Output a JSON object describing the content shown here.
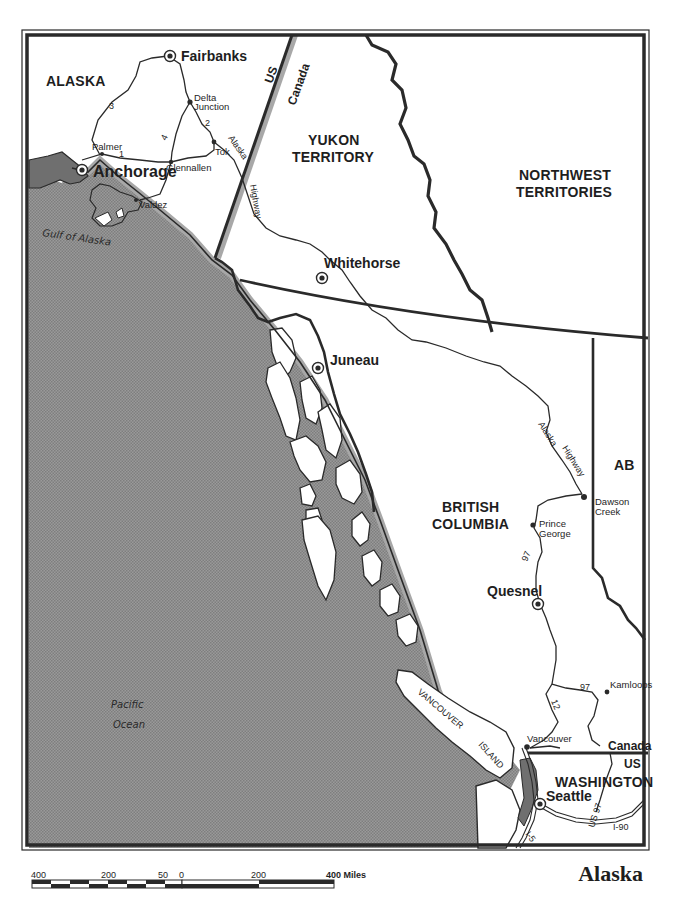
{
  "title": "Alaska",
  "colors": {
    "water": "#8f8f8f",
    "land": "#ffffff",
    "border": "#2a2a2a",
    "coast_shadow": "#a8a8a8",
    "ink": "#1e1e1e"
  },
  "regions": {
    "alaska": "ALASKA",
    "yukon_1": "YUKON",
    "yukon_2": "TERRITORY",
    "nwt_1": "NORTHWEST",
    "nwt_2": "TERRITORIES",
    "bc_1": "BRITISH",
    "bc_2": "COLUMBIA",
    "alberta": "AB",
    "washington": "WASHINGTON"
  },
  "border_labels": {
    "us_north": "US",
    "canada_north": "Canada",
    "canada_south": "Canada",
    "us_south": "US"
  },
  "cities": {
    "fairbanks": "Fairbanks",
    "anchorage": "Anchorage",
    "whitehorse": "Whitehorse",
    "juneau": "Juneau",
    "quesnel": "Quesnel",
    "seattle": "Seattle"
  },
  "towns": {
    "delta_1": "Delta",
    "delta_2": "Junction",
    "palmer": "Palmer",
    "glennallen": "Glennallen",
    "tok": "Tok",
    "valdez": "Valdez",
    "dawson_1": "Dawson",
    "dawson_2": "Creek",
    "prince_1": "Prince",
    "prince_2": "George",
    "kamloops": "Kamloops",
    "vancouver": "Vancouver"
  },
  "routes": {
    "r1": "1",
    "r2": "2",
    "r3": "3",
    "r4": "4",
    "alaska_hwy_north_1": "Alaska",
    "alaska_hwy_north_2": "Highway",
    "alaska_hwy_bc_1": "Alaska",
    "alaska_hwy_bc_2": "Highway",
    "r97_north": "97",
    "r97_south": "97",
    "r12": "12",
    "us97": "US 97",
    "i90": "I-90",
    "i5": "I-5"
  },
  "water": {
    "gulf": "Gulf of Alaska",
    "pacific_1": "Pacific",
    "pacific_2": "Ocean"
  },
  "islands": {
    "vancouver_1": "VANCOUVER",
    "vancouver_2": "ISLAND"
  },
  "scale": {
    "ticks": [
      "400",
      "200",
      "50",
      "0",
      "200",
      "400 Miles"
    ],
    "unit": "Miles"
  }
}
